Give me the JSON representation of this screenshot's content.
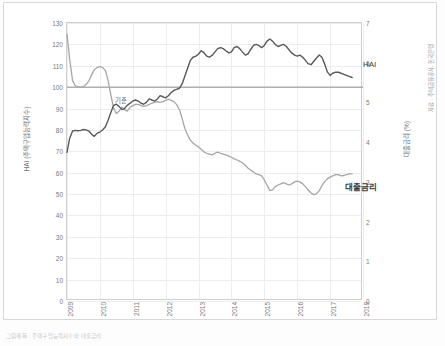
{
  "figure": {
    "corner_note": "자료 : 주택금융공사, 한국은행",
    "caption": "그림제목 : 주택구입능력지수와 대출금리"
  },
  "axes": {
    "left_label": "HAI (주택구입능력지수)",
    "right_label": "대출금리 (%)",
    "left_ticks": [
      0,
      10,
      20,
      30,
      40,
      50,
      60,
      70,
      80,
      90,
      100,
      110,
      120,
      130
    ],
    "right_ticks": [
      0,
      1,
      2,
      3,
      4,
      5,
      6,
      7
    ],
    "x_ticks": [
      "2009",
      "2010",
      "2011",
      "2012",
      "2013",
      "2014",
      "2015",
      "2016",
      "2017",
      "2018"
    ],
    "baseline_label": "기준",
    "baseline_value": 100
  },
  "series_labels": {
    "hai": "HAI",
    "rate": "대출금리"
  },
  "colors": {
    "hai_line": "#595959",
    "rate_line": "#a6a6a6",
    "baseline": "#8c8c8c",
    "grid": "#ededed",
    "axis_text": "#7a7a7a"
  },
  "chart_data": {
    "type": "line",
    "title": "",
    "xlabel": "",
    "ylabel": "HAI (주택구입능력지수)",
    "y2label": "대출금리 (%)",
    "xlim": [
      2009.0,
      2018.0
    ],
    "ylim": [
      0,
      130
    ],
    "y2lim": [
      0,
      7
    ],
    "grid": true,
    "legend": "inline-annotations",
    "annotations": [
      {
        "text": "기준",
        "x": 2009.0,
        "y": 100,
        "axis": "left"
      },
      {
        "text": "HAI",
        "x": 2017.3,
        "y": 110,
        "axis": "left"
      },
      {
        "text": "대출금리",
        "x": 2017.0,
        "y": 3.15,
        "axis": "right"
      }
    ],
    "series": [
      {
        "name": "HAI",
        "axis": "left",
        "color": "#595959",
        "x": [
          2009.0,
          2009.08,
          2009.17,
          2009.25,
          2009.33,
          2009.42,
          2009.5,
          2009.58,
          2009.67,
          2009.75,
          2009.83,
          2009.92,
          2010.0,
          2010.08,
          2010.17,
          2010.25,
          2010.33,
          2010.42,
          2010.5,
          2010.58,
          2010.67,
          2010.75,
          2010.83,
          2010.92,
          2011.0,
          2011.08,
          2011.17,
          2011.25,
          2011.33,
          2011.42,
          2011.5,
          2011.58,
          2011.67,
          2011.75,
          2011.83,
          2011.92,
          2012.0,
          2012.08,
          2012.17,
          2012.25,
          2012.33,
          2012.42,
          2012.5,
          2012.58,
          2012.67,
          2012.75,
          2012.83,
          2012.92,
          2013.0,
          2013.08,
          2013.17,
          2013.25,
          2013.33,
          2013.42,
          2013.5,
          2013.58,
          2013.67,
          2013.75,
          2013.83,
          2013.92,
          2014.0,
          2014.08,
          2014.17,
          2014.25,
          2014.33,
          2014.42,
          2014.5,
          2014.58,
          2014.67,
          2014.75,
          2014.83,
          2014.92,
          2015.0,
          2015.08,
          2015.17,
          2015.25,
          2015.33,
          2015.42,
          2015.5,
          2015.58,
          2015.67,
          2015.75,
          2015.83,
          2015.92,
          2016.0,
          2016.08,
          2016.17,
          2016.25,
          2016.33,
          2016.42,
          2016.5,
          2016.58,
          2016.67,
          2016.75,
          2016.83,
          2016.92,
          2017.0,
          2017.08,
          2017.17,
          2017.25,
          2017.33,
          2017.42,
          2017.5,
          2017.58,
          2017.67
        ],
        "values": [
          69.5,
          76.0,
          79.5,
          79.8,
          79.6,
          79.8,
          80.2,
          80.0,
          79.4,
          78.0,
          77.0,
          78.5,
          79.0,
          80.0,
          81.5,
          84.5,
          88.0,
          91.5,
          92.0,
          91.0,
          89.5,
          90.0,
          91.5,
          92.5,
          93.5,
          94.0,
          93.5,
          92.5,
          92.0,
          93.0,
          94.5,
          94.0,
          93.5,
          94.5,
          96.0,
          95.5,
          95.0,
          96.0,
          97.5,
          98.5,
          99.0,
          99.5,
          101.5,
          105.0,
          109.0,
          112.5,
          114.0,
          114.5,
          115.5,
          117.0,
          116.0,
          114.5,
          114.0,
          115.0,
          116.5,
          118.0,
          118.5,
          118.0,
          117.0,
          116.0,
          116.5,
          118.5,
          119.0,
          118.0,
          116.5,
          115.0,
          115.5,
          117.5,
          119.5,
          120.0,
          119.5,
          118.5,
          119.5,
          121.5,
          122.5,
          121.5,
          120.0,
          119.0,
          119.5,
          120.0,
          119.0,
          117.5,
          116.0,
          115.0,
          114.5,
          115.0,
          114.0,
          112.5,
          111.0,
          110.5,
          112.0,
          113.5,
          115.0,
          114.0,
          111.0,
          107.0,
          105.5,
          106.5,
          107.0,
          107.0,
          106.5,
          106.0,
          105.5,
          105.0,
          104.5
        ]
      },
      {
        "name": "대출금리",
        "axis": "right",
        "color": "#a6a6a6",
        "x": [
          2009.0,
          2009.08,
          2009.17,
          2009.25,
          2009.33,
          2009.42,
          2009.5,
          2009.58,
          2009.67,
          2009.75,
          2009.83,
          2009.92,
          2010.0,
          2010.08,
          2010.17,
          2010.25,
          2010.33,
          2010.42,
          2010.5,
          2010.58,
          2010.67,
          2010.75,
          2010.83,
          2010.92,
          2011.0,
          2011.08,
          2011.17,
          2011.25,
          2011.33,
          2011.42,
          2011.5,
          2011.58,
          2011.67,
          2011.75,
          2011.83,
          2011.92,
          2012.0,
          2012.08,
          2012.17,
          2012.25,
          2012.33,
          2012.42,
          2012.5,
          2012.58,
          2012.67,
          2012.75,
          2012.83,
          2012.92,
          2013.0,
          2013.08,
          2013.17,
          2013.25,
          2013.33,
          2013.42,
          2013.5,
          2013.58,
          2013.67,
          2013.75,
          2013.83,
          2013.92,
          2014.0,
          2014.08,
          2014.17,
          2014.25,
          2014.33,
          2014.42,
          2014.5,
          2014.58,
          2014.67,
          2014.75,
          2014.83,
          2014.92,
          2015.0,
          2015.08,
          2015.17,
          2015.25,
          2015.33,
          2015.42,
          2015.5,
          2015.58,
          2015.67,
          2015.75,
          2015.83,
          2015.92,
          2016.0,
          2016.08,
          2016.17,
          2016.25,
          2016.33,
          2016.42,
          2016.5,
          2016.58,
          2016.67,
          2016.75,
          2016.83,
          2016.92,
          2017.0,
          2017.08,
          2017.17,
          2017.25,
          2017.33,
          2017.42,
          2017.5,
          2017.58,
          2017.67
        ],
        "values": [
          6.72,
          6.1,
          5.55,
          5.42,
          5.4,
          5.38,
          5.4,
          5.45,
          5.55,
          5.7,
          5.82,
          5.88,
          5.9,
          5.88,
          5.8,
          5.55,
          5.2,
          4.85,
          4.72,
          4.78,
          4.88,
          4.82,
          4.78,
          4.88,
          4.92,
          4.95,
          4.95,
          4.92,
          4.9,
          4.92,
          4.95,
          4.98,
          5.0,
          5.02,
          5.0,
          5.02,
          5.05,
          5.08,
          5.05,
          5.02,
          4.95,
          4.82,
          4.6,
          4.35,
          4.18,
          4.05,
          3.98,
          3.92,
          3.88,
          3.82,
          3.75,
          3.72,
          3.7,
          3.68,
          3.72,
          3.75,
          3.72,
          3.7,
          3.68,
          3.65,
          3.62,
          3.58,
          3.55,
          3.52,
          3.48,
          3.42,
          3.35,
          3.3,
          3.25,
          3.2,
          3.18,
          3.15,
          3.05,
          2.92,
          2.78,
          2.8,
          2.88,
          2.92,
          2.95,
          2.98,
          2.95,
          2.92,
          2.95,
          3.0,
          3.02,
          3.0,
          2.95,
          2.88,
          2.8,
          2.72,
          2.68,
          2.7,
          2.78,
          2.9,
          3.0,
          3.08,
          3.12,
          3.15,
          3.18,
          3.18,
          3.15,
          3.16,
          3.18,
          3.2,
          3.2
        ]
      }
    ]
  }
}
